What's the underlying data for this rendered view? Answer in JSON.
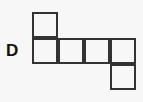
{
  "diagram": {
    "label": "D",
    "type": "cube-net",
    "stroke_color": "#333333",
    "squares": [
      {
        "row": 0,
        "col": 0
      },
      {
        "row": 1,
        "col": 0
      },
      {
        "row": 1,
        "col": 1
      },
      {
        "row": 1,
        "col": 2
      },
      {
        "row": 1,
        "col": 3
      },
      {
        "row": 2,
        "col": 3
      }
    ]
  }
}
